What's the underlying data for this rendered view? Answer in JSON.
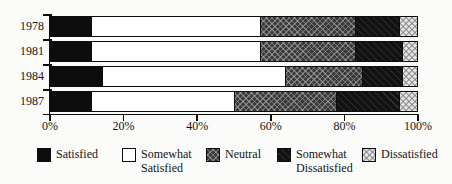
{
  "chart_data": {
    "type": "bar",
    "orientation": "horizontal",
    "stacked": true,
    "title": "",
    "xlabel": "",
    "ylabel": "",
    "xlim": [
      0,
      100
    ],
    "grid": false,
    "legend_position": "bottom",
    "categories": [
      "1978",
      "1981",
      "1984",
      "1987"
    ],
    "x_ticks": [
      {
        "value": 0,
        "label": "0%"
      },
      {
        "value": 20,
        "label": "20%"
      },
      {
        "value": 40,
        "label": "40%"
      },
      {
        "value": 60,
        "label": "60%"
      },
      {
        "value": 80,
        "label": "80%"
      },
      {
        "value": 100,
        "label": "100%"
      }
    ],
    "series": [
      {
        "name": "Satisfied",
        "fill": "solid-black",
        "values": [
          11,
          11,
          14,
          11
        ]
      },
      {
        "name": "Somewhat Satisfied",
        "fill": "white",
        "values": [
          46,
          46,
          50,
          39
        ]
      },
      {
        "name": "Neutral",
        "fill": "dark-crosshatch",
        "values": [
          26,
          26,
          21,
          28
        ]
      },
      {
        "name": "Somewhat Dissatisfied",
        "fill": "near-black",
        "values": [
          12,
          13,
          11,
          17
        ]
      },
      {
        "name": "Dissatisfied",
        "fill": "light-checker",
        "values": [
          5,
          4,
          4,
          5
        ]
      }
    ]
  },
  "legend": {
    "items": [
      {
        "label": "Satisfied",
        "fill": "solid-black",
        "x": 37
      },
      {
        "label": "Somewhat Satisfied",
        "fill": "white",
        "x": 122
      },
      {
        "label": "Neutral",
        "fill": "dark-crosshatch",
        "x": 206
      },
      {
        "label": "Somewhat Dissatisfied",
        "fill": "near-black",
        "x": 277
      },
      {
        "label": "Dissatisfied",
        "fill": "light-checker",
        "x": 362
      }
    ]
  },
  "colors": {
    "axis": "#0d0d0d",
    "bar_border": "#0d0d0d",
    "background": "#fbfbf9",
    "solid_black": "#0d0d0d",
    "white": "#ffffff",
    "dark_gray_pattern": "#3a3a3a",
    "near_black_pattern": "#121212",
    "light_gray_pattern": "#e3e3e1"
  },
  "layout": {
    "plot_left": 50,
    "plot_width": 368,
    "bars_top": 16,
    "row_pitch": 25,
    "bar_height": 21
  }
}
